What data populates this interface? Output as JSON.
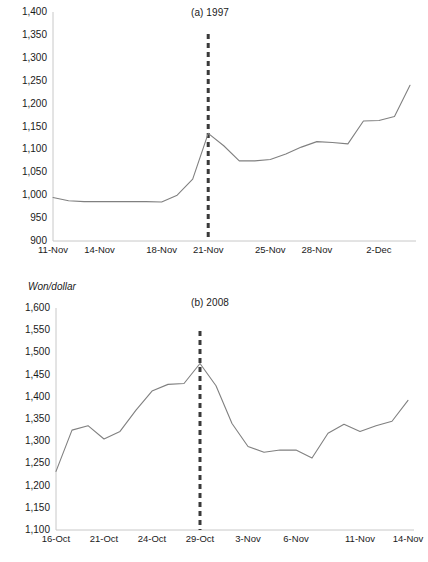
{
  "figure": {
    "background_color": "#ffffff",
    "line_color": "#808080",
    "event_line_color": "#3a3a3a",
    "axis_color": "#c8c8c8",
    "text_color": "#1a1a1a"
  },
  "panel_a": {
    "title": "(a) 1997",
    "ytick_labels": [
      "1,400",
      "1,350",
      "1,300",
      "1,250",
      "1,200",
      "1,150",
      "1,100",
      "1,050",
      "1,000",
      "950",
      "900"
    ],
    "xtick_labels": [
      "11-Nov",
      "14-Nov",
      "18-Nov",
      "21-Nov",
      "25-Nov",
      "28-Nov",
      "2-Dec"
    ]
  },
  "panel_b": {
    "axis_unit_label": "Won/dollar",
    "title": "(b) 2008",
    "ytick_labels": [
      "1,600",
      "1,550",
      "1,500",
      "1,450",
      "1,400",
      "1,350",
      "1,300",
      "1,250",
      "1,200",
      "1,150",
      "1,100"
    ],
    "xtick_labels": [
      "16-Oct",
      "21-Oct",
      "24-Oct",
      "29-Oct",
      "3-Nov",
      "6-Nov",
      "11-Nov",
      "14-Nov"
    ]
  },
  "chart_data": [
    {
      "type": "line",
      "title": "(a) 1997",
      "xlabel": "",
      "ylabel": "",
      "ylim": [
        900,
        1400
      ],
      "ytick_step": 50,
      "yticks": [
        900,
        950,
        1000,
        1050,
        1100,
        1150,
        1200,
        1250,
        1300,
        1350,
        1400
      ],
      "grid": false,
      "legend": "none",
      "xtick_labels": [
        "11-Nov",
        "14-Nov",
        "18-Nov",
        "21-Nov",
        "25-Nov",
        "28-Nov",
        "2-Dec"
      ],
      "xtick_indices": [
        0,
        3,
        7,
        10,
        14,
        17,
        21
      ],
      "x": [
        "11-Nov",
        "12-Nov",
        "13-Nov",
        "14-Nov",
        "15-Nov",
        "16-Nov",
        "17-Nov",
        "18-Nov",
        "19-Nov",
        "20-Nov",
        "21-Nov",
        "22-Nov",
        "23-Nov",
        "24-Nov",
        "25-Nov",
        "26-Nov",
        "27-Nov",
        "28-Nov",
        "29-Nov",
        "30-Nov",
        "1-Dec",
        "2-Dec",
        "3-Dec",
        "4-Dec"
      ],
      "series": [
        {
          "name": "Won/dollar",
          "values": [
            995,
            988,
            986,
            986,
            986,
            986,
            986,
            985,
            1000,
            1035,
            1135,
            1108,
            1075,
            1075,
            1078,
            1090,
            1105,
            1117,
            1115,
            1112,
            1162,
            1163,
            1172,
            1240
          ]
        }
      ],
      "annotations": [
        {
          "type": "vertical-dashed-line",
          "label": "IMF bailout request",
          "x": "21-Nov",
          "x_index": 10,
          "color": "#3a3a3a",
          "y_from": 900,
          "y_to": 1352
        }
      ]
    },
    {
      "type": "line",
      "title": "(b) 2008",
      "xlabel": "",
      "ylabel": "Won/dollar",
      "ylim": [
        1100,
        1600
      ],
      "ytick_step": 50,
      "yticks": [
        1100,
        1150,
        1200,
        1250,
        1300,
        1350,
        1400,
        1450,
        1500,
        1550,
        1600
      ],
      "grid": false,
      "legend": "none",
      "xtick_labels": [
        "16-Oct",
        "21-Oct",
        "24-Oct",
        "29-Oct",
        "3-Nov",
        "6-Nov",
        "11-Nov",
        "14-Nov"
      ],
      "xtick_indices": [
        0,
        3,
        6,
        9,
        12,
        15,
        19,
        22
      ],
      "x": [
        "16-Oct",
        "17-Oct",
        "20-Oct",
        "21-Oct",
        "22-Oct",
        "23-Oct",
        "24-Oct",
        "27-Oct",
        "28-Oct",
        "29-Oct",
        "30-Oct",
        "31-Oct",
        "3-Nov",
        "4-Nov",
        "5-Nov",
        "6-Nov",
        "7-Nov",
        "10-Nov",
        "11-Nov",
        "12-Nov",
        "13-Nov",
        "14-Nov",
        "17-Nov"
      ],
      "series": [
        {
          "name": "Won/dollar",
          "values": [
            1232,
            1325,
            1335,
            1305,
            1322,
            1370,
            1413,
            1428,
            1430,
            1475,
            1425,
            1340,
            1288,
            1275,
            1280,
            1280,
            1262,
            1318,
            1338,
            1322,
            1335,
            1345,
            1392
          ]
        }
      ],
      "annotations": [
        {
          "type": "vertical-dashed-line",
          "label": "Fed swap line announcement",
          "x": "29-Oct",
          "x_index": 9,
          "color": "#3a3a3a",
          "y_from": 1100,
          "y_to": 1548
        }
      ]
    }
  ]
}
